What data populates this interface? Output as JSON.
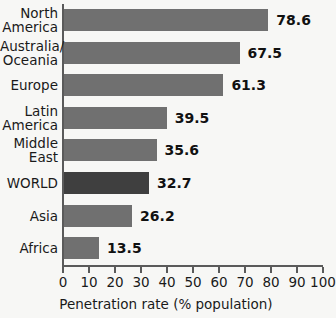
{
  "chart_data": {
    "type": "bar",
    "orientation": "horizontal",
    "title": "",
    "xlabel": "Penetration rate (% population)",
    "ylabel": "",
    "xlim": [
      0,
      100
    ],
    "xticks": [
      0,
      10,
      20,
      30,
      40,
      50,
      60,
      70,
      80,
      90,
      100
    ],
    "grid": false,
    "legend": null,
    "categories": [
      "North\nAmerica",
      "Australia/\nOceania",
      "Europe",
      "Latin\nAmerica",
      "Middle\nEast",
      "WORLD",
      "Asia",
      "Africa"
    ],
    "values": [
      78.6,
      67.5,
      61.3,
      39.5,
      35.6,
      32.7,
      26.2,
      13.5
    ],
    "value_labels": [
      "78.6",
      "67.5",
      "61.3",
      "39.5",
      "35.6",
      "32.7",
      "26.2",
      "13.5"
    ],
    "highlight_index": 5,
    "colors": {
      "bar": "#707070",
      "bar_highlight": "#3f3f3f",
      "axis": "#5a5a5a",
      "text": "#1a1a1a",
      "background": "#f7f7f5"
    }
  }
}
